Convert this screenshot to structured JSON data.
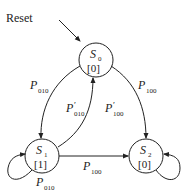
{
  "diagram": {
    "type": "state-machine",
    "reset_label": "Reset",
    "states": [
      {
        "id": "S0",
        "name": "S",
        "sub": "0",
        "output": "[0]"
      },
      {
        "id": "S1",
        "name": "S",
        "sub": "1",
        "output": "[1]"
      },
      {
        "id": "S2",
        "name": "S",
        "sub": "2",
        "output": "[0]"
      }
    ],
    "transitions": [
      {
        "from": "S0",
        "to": "S1",
        "label": "P",
        "sub": "010",
        "prime": ""
      },
      {
        "from": "S1",
        "to": "S0",
        "label": "P",
        "sub": "010",
        "prime": "′"
      },
      {
        "from": "S0",
        "to": "S2",
        "label": "P",
        "sub": "100",
        "prime": ""
      },
      {
        "from": "S0",
        "to": "S0",
        "label": "P",
        "sub": "100",
        "prime": "′"
      },
      {
        "from": "S1",
        "to": "S2",
        "label": "P",
        "sub": "100",
        "prime": ""
      },
      {
        "from": "S1",
        "to": "S1",
        "label": "P",
        "sub": "010",
        "prime": ""
      },
      {
        "from": "S2",
        "to": "S2",
        "label": "",
        "sub": "",
        "prime": ""
      }
    ]
  }
}
